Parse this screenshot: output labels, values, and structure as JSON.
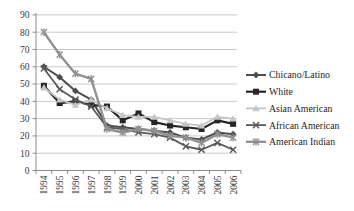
{
  "chart_data": {
    "type": "line",
    "title": "",
    "xlabel": "",
    "ylabel": "",
    "categories": [
      "1994",
      "1995",
      "1996",
      "1997",
      "1998",
      "1999",
      "2000",
      "2001",
      "2002",
      "2003",
      "2004",
      "2005",
      "2006"
    ],
    "series": [
      {
        "name": "Chicano/Latino",
        "marker": "diamond",
        "color": "#4d4d4d",
        "width": 2.0,
        "values": [
          60,
          54,
          46,
          41,
          26,
          25,
          24,
          23,
          22,
          19,
          18,
          22,
          21
        ]
      },
      {
        "name": "White",
        "marker": "square",
        "color": "#262626",
        "width": 2.2,
        "values": [
          49,
          39,
          40,
          38,
          37,
          29,
          33,
          28,
          26,
          25,
          24,
          29,
          27
        ]
      },
      {
        "name": "Asian American",
        "marker": "triangle",
        "color": "#c6c6c6",
        "width": 1.8,
        "values": [
          48,
          41,
          38,
          41,
          36,
          32,
          31,
          31,
          29,
          27,
          26,
          31,
          30
        ]
      },
      {
        "name": "African American",
        "marker": "x",
        "color": "#595959",
        "width": 1.8,
        "values": [
          59,
          47,
          41,
          37,
          25,
          24,
          22,
          21,
          19,
          14,
          12,
          16,
          12
        ]
      },
      {
        "name": "American Indian",
        "marker": "star",
        "color": "#919191",
        "width": 2.4,
        "values": [
          80,
          67,
          56,
          53,
          24,
          22,
          24,
          23,
          20,
          19,
          16,
          21,
          19
        ]
      }
    ],
    "yticks": [
      0,
      10,
      20,
      30,
      40,
      50,
      60,
      70,
      80,
      90
    ],
    "ylim": [
      0,
      90
    ],
    "grid": true,
    "legend_position": "right",
    "colors": {
      "grid": "#c9c9c9",
      "axis": "#8c8c8c",
      "tick_label": "#3a3a3a",
      "legend_text": "#262626",
      "background": "#ffffff"
    }
  }
}
